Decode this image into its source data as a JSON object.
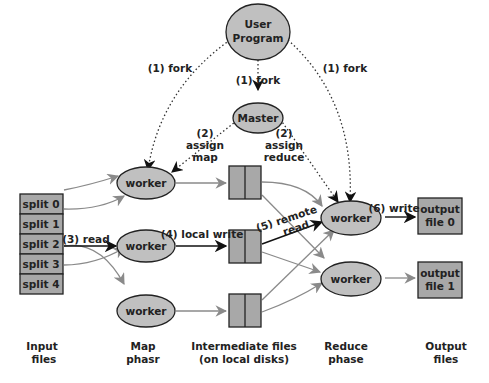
{
  "diagram": {
    "title": "",
    "nodes": {
      "user_program": {
        "line1": "User",
        "line2": "Program"
      },
      "master": {
        "label": "Master"
      },
      "map_workers": [
        {
          "label": "worker"
        },
        {
          "label": "worker"
        },
        {
          "label": "worker"
        }
      ],
      "reduce_workers": [
        {
          "label": "worker"
        },
        {
          "label": "worker"
        }
      ],
      "splits": [
        {
          "label": "split 0"
        },
        {
          "label": "split 1"
        },
        {
          "label": "split 2"
        },
        {
          "label": "split 3"
        },
        {
          "label": "split 4"
        }
      ],
      "outputs": [
        {
          "line1": "output",
          "line2": "file 0"
        },
        {
          "line1": "output",
          "line2": "file 1"
        }
      ]
    },
    "edge_labels": {
      "fork_left": "(1) fork",
      "fork_center": "(1) fork",
      "fork_right": "(1) fork",
      "assign_map_num": "(2)",
      "assign_map_1": "assign",
      "assign_map_2": "map",
      "assign_reduce_num": "(2)",
      "assign_reduce_1": "assign",
      "assign_reduce_2": "reduce",
      "read": "(3) read",
      "local_write": "(4) local write",
      "remote_read_1": "(5) remote",
      "remote_read_2": "read",
      "write": "(6) write"
    },
    "columns": [
      {
        "line1": "Input",
        "line2": "files"
      },
      {
        "line1": "Map",
        "line2": "phasr"
      },
      {
        "line1": "Intermediate files",
        "line2": "(on local disks)"
      },
      {
        "line1": "Reduce",
        "line2": "phase"
      },
      {
        "line1": "Output",
        "line2": "files"
      }
    ],
    "colors": {
      "node_fill": "#c0c0c0",
      "box_fill": "#a8a8a8",
      "stroke": "#222222",
      "gray_arrow": "#8a8a8a",
      "black_arrow": "#111111"
    }
  }
}
